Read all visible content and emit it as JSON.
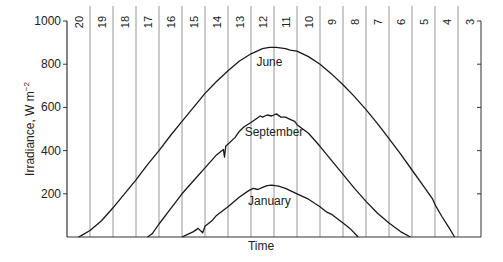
{
  "chart_data": {
    "type": "line",
    "title": "",
    "xlabel": "Time",
    "ylabel": "Irradiance, W m⁻²",
    "ylabel_main": "Irradiance, W m",
    "ylabel_sup": "−2",
    "ylim": [
      0,
      1000
    ],
    "yticks": [
      200,
      400,
      600,
      800,
      1000
    ],
    "x_hour_labels": [
      "20",
      "19",
      "18",
      "17",
      "16",
      "15",
      "14",
      "13",
      "12",
      "11",
      "10",
      "9",
      "8",
      "7",
      "6",
      "5",
      "4",
      "3"
    ],
    "x_axis_direction": "reversed (hour 20 on left, hour 3 on right)",
    "grid": "vertical lines between hour labels",
    "legend": "inline labels",
    "series": [
      {
        "name": "June",
        "label_pos": [
          11.7,
          790
        ],
        "points": [
          [
            20.0,
            0
          ],
          [
            19.9,
            5
          ],
          [
            19.5,
            30
          ],
          [
            19,
            75
          ],
          [
            18.5,
            135
          ],
          [
            18,
            200
          ],
          [
            17.5,
            265
          ],
          [
            17,
            335
          ],
          [
            16.5,
            400
          ],
          [
            16,
            470
          ],
          [
            15.5,
            535
          ],
          [
            15,
            600
          ],
          [
            14.5,
            665
          ],
          [
            14,
            720
          ],
          [
            13.5,
            770
          ],
          [
            13,
            815
          ],
          [
            12.5,
            848
          ],
          [
            12,
            872
          ],
          [
            11.7,
            878
          ],
          [
            11.4,
            878
          ],
          [
            11,
            872
          ],
          [
            10.8,
            865
          ],
          [
            10.5,
            860
          ],
          [
            10,
            835
          ],
          [
            9.5,
            800
          ],
          [
            9,
            755
          ],
          [
            8.5,
            705
          ],
          [
            8,
            650
          ],
          [
            7.5,
            590
          ],
          [
            7,
            525
          ],
          [
            6.5,
            455
          ],
          [
            6,
            385
          ],
          [
            5.5,
            310
          ],
          [
            5,
            235
          ],
          [
            4.6,
            175
          ],
          [
            4.5,
            150
          ],
          [
            4.2,
            95
          ],
          [
            3.9,
            45
          ],
          [
            3.65,
            0
          ]
        ]
      },
      {
        "name": "September",
        "label_pos": [
          11.5,
          466
        ],
        "points": [
          [
            17.0,
            0
          ],
          [
            16.8,
            15
          ],
          [
            16.5,
            60
          ],
          [
            16,
            130
          ],
          [
            15.5,
            200
          ],
          [
            15,
            260
          ],
          [
            14.5,
            320
          ],
          [
            14,
            380
          ],
          [
            13.7,
            405
          ],
          [
            13.65,
            370
          ],
          [
            13.6,
            420
          ],
          [
            13.2,
            460
          ],
          [
            13,
            490
          ],
          [
            12.8,
            510
          ],
          [
            12.5,
            530
          ],
          [
            12.3,
            545
          ],
          [
            12.1,
            560
          ],
          [
            12,
            555
          ],
          [
            11.8,
            565
          ],
          [
            11.6,
            560
          ],
          [
            11.4,
            570
          ],
          [
            11.2,
            555
          ],
          [
            11,
            555
          ],
          [
            10.8,
            545
          ],
          [
            10.6,
            535
          ],
          [
            10.5,
            520
          ],
          [
            10,
            480
          ],
          [
            9.5,
            420
          ],
          [
            9,
            355
          ],
          [
            8.5,
            290
          ],
          [
            8,
            225
          ],
          [
            7.5,
            165
          ],
          [
            7,
            110
          ],
          [
            6.5,
            65
          ],
          [
            6,
            25
          ],
          [
            5.57,
            0
          ]
        ]
      },
      {
        "name": "January",
        "label_pos": [
          11.7,
          150
        ],
        "points": [
          [
            15.5,
            0
          ],
          [
            15.3,
            10
          ],
          [
            15.0,
            25
          ],
          [
            14.8,
            40
          ],
          [
            14.6,
            20
          ],
          [
            14.5,
            50
          ],
          [
            14.2,
            75
          ],
          [
            14,
            100
          ],
          [
            13.5,
            140
          ],
          [
            13,
            185
          ],
          [
            12.6,
            215
          ],
          [
            12.4,
            225
          ],
          [
            12.2,
            220
          ],
          [
            12,
            230
          ],
          [
            11.8,
            238
          ],
          [
            11.6,
            240
          ],
          [
            11.3,
            235
          ],
          [
            11,
            225
          ],
          [
            10.5,
            200
          ],
          [
            10,
            175
          ],
          [
            9.5,
            140
          ],
          [
            9.2,
            115
          ],
          [
            9,
            105
          ],
          [
            8.5,
            65
          ],
          [
            8.2,
            40
          ],
          [
            7.84,
            0
          ]
        ]
      }
    ]
  },
  "axes": {
    "ylabel_main": "Irradiance, W m",
    "ylabel_sup": "−2",
    "xlabel": "Time"
  }
}
